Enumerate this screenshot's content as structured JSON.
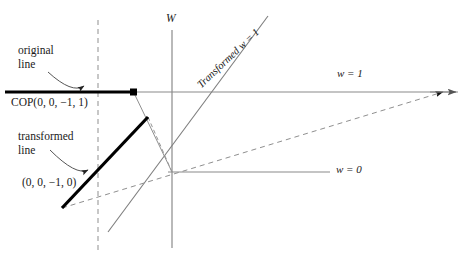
{
  "figure": {
    "background_color": "#ffffff",
    "line_color": "#808080",
    "emphasis_color": "#000000",
    "text_color": "#1a1a1a"
  },
  "annotations": {
    "original_line_1": "original",
    "original_line_2": "line",
    "transformed_line_1": "transformed",
    "transformed_line_2": "line",
    "rotated_label": "Transformed w = 1"
  },
  "points": {
    "cop": "COP(0, 0, −1, 1)",
    "direction": "(0, 0, −1, 0)"
  },
  "axes": {
    "w_axis": "W",
    "w_equals_one": "w = 1",
    "w_equals_zero": "w = 0"
  },
  "geometry": {
    "w_axis_x": 172,
    "w1_line_y": 92,
    "w0_line_y": 172,
    "dashed_vertical_x": 98,
    "original_line": {
      "x1": 5,
      "y1": 92,
      "x2": 134,
      "y2": 92
    },
    "transformed_line": {
      "x1": 62,
      "y1": 208,
      "x2": 148,
      "y2": 117
    }
  }
}
